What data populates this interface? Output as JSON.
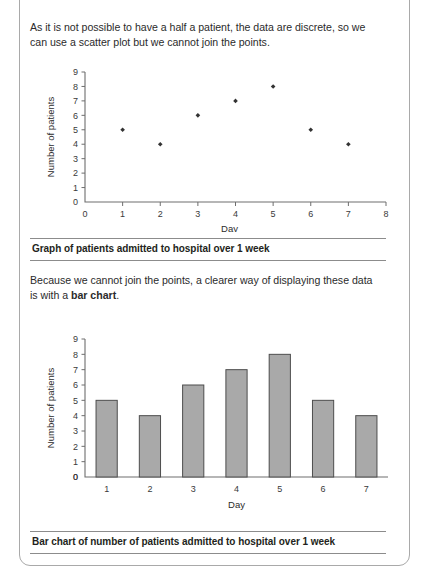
{
  "page": {
    "paragraph_1": "As it is not possible to have a half a patient, the data are discrete, so we can use a scatter plot but we cannot join the points.",
    "paragraph_2_part_1": "Because we cannot join the points, a clearer way of displaying these data is with a ",
    "paragraph_2_bold": "bar chart",
    "paragraph_2_part_2": ".",
    "caption_1": "Graph of patients admitted to hospital over 1 week",
    "caption_2": "Bar chart of number of patients admitted to hospital over 1 week"
  },
  "colors": {
    "bar_fill": "#a9a9a9",
    "bar_stroke": "#4d4d4d",
    "axis": "#6e6e6e",
    "marker": "#333333",
    "text": "#231f20",
    "page_border": "#a9a9a9"
  },
  "chart_data": [
    {
      "type": "scatter",
      "title": "Graph of patients admitted to hospital over 1 week",
      "xlabel": "Day",
      "ylabel": "Number of patients",
      "x": [
        1,
        2,
        3,
        4,
        5,
        6,
        7
      ],
      "values": [
        5,
        4,
        6,
        7,
        8,
        5,
        4
      ],
      "xlim": [
        0,
        8
      ],
      "ylim": [
        0,
        9
      ],
      "xticks": [
        0,
        1,
        2,
        3,
        4,
        5,
        6,
        7,
        8
      ],
      "yticks": [
        0,
        1,
        2,
        3,
        4,
        5,
        6,
        7,
        8,
        9
      ],
      "xtick_labels": [
        "0",
        "1",
        "2",
        "3",
        "4",
        "5",
        "6",
        "7",
        "8"
      ],
      "ytick_labels": [
        "0",
        "1",
        "2",
        "3",
        "4",
        "5",
        "6",
        "7",
        "8",
        "9"
      ],
      "grid": false,
      "legend": null,
      "marker": "diamond"
    },
    {
      "type": "bar",
      "title": "Bar chart of number of patients admitted to hospital over 1 week",
      "xlabel": "Day",
      "ylabel": "Number of patients",
      "categories": [
        "1",
        "2",
        "3",
        "4",
        "5",
        "6",
        "7"
      ],
      "values": [
        5,
        4,
        6,
        7,
        8,
        5,
        4
      ],
      "ylim": [
        0,
        9
      ],
      "yticks": [
        0,
        1,
        2,
        3,
        4,
        5,
        6,
        7,
        8,
        9
      ],
      "ytick_labels": [
        "0",
        "1",
        "2",
        "3",
        "4",
        "5",
        "6",
        "7",
        "8",
        "9"
      ],
      "grid": false,
      "legend": null
    }
  ]
}
